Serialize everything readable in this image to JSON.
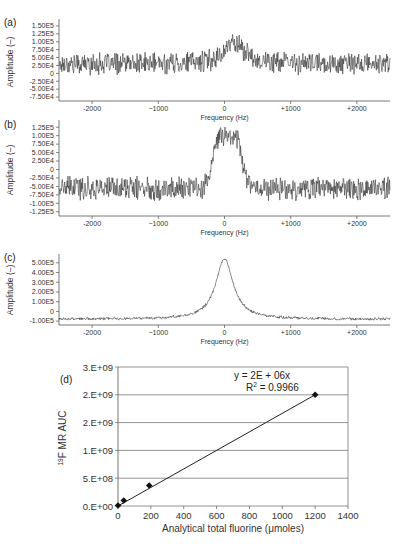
{
  "chart_data": [
    {
      "panel": "(a)",
      "type": "line",
      "xlabel": "Frequency (Hz)",
      "ylabel": "Amplitude (–)",
      "xlim": [
        -2500,
        2500
      ],
      "ylim": [
        -87500,
        162500
      ],
      "x_ticks": [
        -2000,
        -1000,
        0,
        1000,
        2000
      ],
      "x_tick_labels": [
        "-2000",
        "−1000",
        "0",
        "+1000",
        "+2000"
      ],
      "y_ticks": [
        150000,
        125000,
        100000,
        75000,
        50000,
        25000,
        0,
        -25000,
        -50000,
        -75000
      ],
      "y_tick_labels": [
        "1.50E5",
        "1.25E5",
        "1.00E5",
        "7.50E4",
        "5.00E4",
        "2.50E4",
        "0",
        "-2.50E4",
        "-5.00E4",
        "-7.50E4"
      ],
      "signal": {
        "baseline": 30000,
        "noise": 28000,
        "peak_center": 150,
        "peak_height": 70000,
        "peak_width": 180
      },
      "description": "Noisy spectrum with weak peak near +150 Hz reaching ~1.5E5"
    },
    {
      "panel": "(b)",
      "type": "line",
      "xlabel": "Frequency (Hz)",
      "ylabel": "Amplitude (–)",
      "xlim": [
        -2500,
        2500
      ],
      "ylim": [
        -137500,
        137500
      ],
      "x_ticks": [
        -2000,
        -1000,
        0,
        1000,
        2000
      ],
      "x_tick_labels": [
        "-2000",
        "−1000",
        "0",
        "+1000",
        "+2000"
      ],
      "y_ticks": [
        125000,
        100000,
        75000,
        50000,
        25000,
        0,
        -25000,
        -50000,
        -75000,
        -100000,
        -125000
      ],
      "y_tick_labels": [
        "1.25E5",
        "1.00E5",
        "7.50E4",
        "5.00E4",
        "2.50E4",
        "0",
        "-2.50E4",
        "-5.00E4",
        "-7.50E4",
        "-1.00E5",
        "-1.25E5"
      ],
      "signal": {
        "baseline": -55000,
        "noise": 28000,
        "peak_center": 50,
        "peak_height": 155000,
        "peak_width": 230
      },
      "description": "Noisy spectrum with broad peak centered near 0 Hz reaching ~1.1E5"
    },
    {
      "panel": "(c)",
      "type": "line",
      "xlabel": "Frequency (Hz)",
      "ylabel": "Amplitude (–)",
      "xlim": [
        -2500,
        2500
      ],
      "ylim": [
        -140000,
        560000
      ],
      "x_ticks": [
        -2000,
        -1000,
        0,
        1000,
        2000
      ],
      "x_tick_labels": [
        "-2000",
        "−1000",
        "0",
        "+1000",
        "+2000"
      ],
      "y_ticks": [
        500000,
        400000,
        300000,
        200000,
        100000,
        0,
        -100000
      ],
      "y_tick_labels": [
        "5.00E5",
        "4.00E5",
        "3.00E5",
        "2.00E5",
        "1.00E5",
        "0",
        "-1.00E5"
      ],
      "signal": {
        "baseline": -80000,
        "noise": 12000,
        "peak_center": 0,
        "peak_height": 620000,
        "peak_width": 160
      },
      "description": "Clean Lorentzian-like peak at 0 Hz reaching ~5.4E5, baseline ~ -8E4"
    },
    {
      "panel": "(d)",
      "type": "scatter",
      "xlabel": "Analytical total fluorine (μmoles)",
      "ylabel": "19F MR AUC",
      "ylabel_sup": "19",
      "ylabel_main": "F MR AUC",
      "xlim": [
        0,
        1400
      ],
      "ylim": [
        0,
        2500000000
      ],
      "x_ticks": [
        0,
        200,
        400,
        600,
        800,
        1000,
        1200,
        1400
      ],
      "x_tick_labels": [
        "0",
        "200",
        "400",
        "600",
        "800",
        "1000",
        "1200",
        "1400"
      ],
      "y_ticks": [
        0,
        500000000,
        1000000000,
        1500000000,
        2000000000,
        2500000000
      ],
      "y_tick_labels": [
        "0.E+00",
        "5.E+08",
        "1.E+09",
        "2.E+09",
        "2.E+09",
        "3.E+09"
      ],
      "grid": "horizontal",
      "points": [
        {
          "x": 0,
          "y": 10000000
        },
        {
          "x": 35,
          "y": 100000000
        },
        {
          "x": 190,
          "y": 370000000
        },
        {
          "x": 1200,
          "y": 2000000000
        }
      ],
      "trendline": {
        "x": [
          0,
          1200
        ],
        "y": [
          0,
          2000000000
        ]
      },
      "equation": "y = 2E + 06x",
      "r2_prefix": "R",
      "r2_sup": "2",
      "r2_value": " = 0.9966"
    }
  ]
}
